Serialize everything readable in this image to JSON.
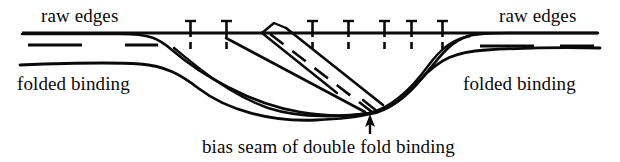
{
  "figure": {
    "background_color": "#ffffff",
    "ink_color": "#0a0a0a",
    "width": 620,
    "height": 162
  },
  "labels": {
    "raw_edges_left": "raw edges",
    "raw_edges_right": "raw edges",
    "folded_binding_left": "folded binding",
    "folded_binding_right": "folded binding",
    "caption": "bias seam of double fold binding"
  },
  "annotations": {
    "arrow": {
      "name": "caption-arrow",
      "points_to": "bias seam convergence point",
      "tip_x": 370,
      "tip_y": 116,
      "tail_x": 370,
      "tail_y": 134
    }
  },
  "markers": {
    "pin_label": "pin",
    "pin_count": 7,
    "pin_positions_x": [
      190,
      226,
      312,
      348,
      384,
      411,
      442
    ],
    "pin_head_y": 21,
    "pin_line_y": 33,
    "pin_tail_y": 44
  },
  "strokes": {
    "raw_edge_line_label": "raw edge stitch line",
    "dash_segment_label": "basting dash",
    "binding_fold_label": "folded binding edge",
    "bias_seam_label": "bias seam dashed line",
    "binding_band_label": "double fold binding band"
  }
}
